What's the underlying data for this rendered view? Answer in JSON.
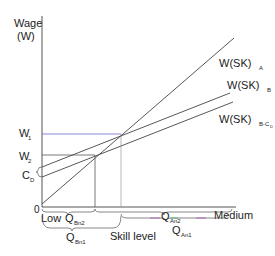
{
  "axes": {
    "y_label_line1": "Wage",
    "y_label_line2": "(W)",
    "origin": "0",
    "x_low": "Low",
    "x_high": "Medium",
    "x_title": "Skill level"
  },
  "y_ticks": {
    "w1": "W",
    "w1_sub": "1",
    "w2": "W",
    "w2_sub": "2",
    "cd": "C",
    "cd_sub": "D"
  },
  "lines": [
    {
      "name": "W(SK)",
      "sub": "A"
    },
    {
      "name": "W(SK)",
      "sub": "B"
    },
    {
      "name": "W(SK)",
      "sub": "B-C",
      "subsub": "D"
    }
  ],
  "x_marks": {
    "qbn2": "Q",
    "qbn2_sub": "Bn2",
    "qbn1": "Q",
    "qbn1_sub": "Bn1",
    "qan2": "Q",
    "qan2_sub": "An2",
    "qan1": "Q",
    "qan1_sub": "An1"
  },
  "colors": {
    "axis": "#555555",
    "curve": "#444444",
    "w1_guide": "#6b6bd6",
    "w2_guide": "#555555",
    "brace_accent": "#b04fc0",
    "brace_accent2": "#3fae6a"
  }
}
